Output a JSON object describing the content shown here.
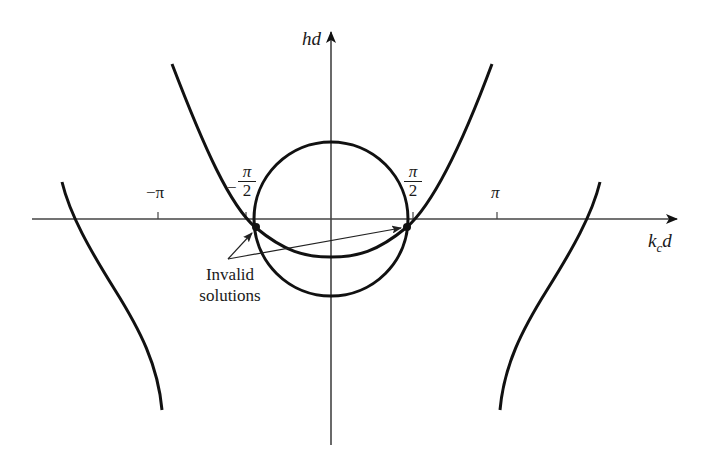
{
  "figure": {
    "y_axis_label": "hd",
    "x_axis_label_main": "k",
    "x_axis_label_sub": "c",
    "x_axis_label_tail": "d",
    "ticks": [
      {
        "label": "−π",
        "value": "-pi"
      },
      {
        "label_num": "π",
        "label_den": "2",
        "label_sign": "−",
        "value": "-pi/2"
      },
      {
        "label_num": "π",
        "label_den": "2",
        "label_sign": "",
        "value": "pi/2"
      },
      {
        "label": "π",
        "value": "pi"
      }
    ],
    "annotation": {
      "line1": "Invalid",
      "line2": "solutions"
    },
    "colors": {
      "curve": "#111111",
      "axis": "#444444",
      "background": "#ffffff"
    }
  }
}
